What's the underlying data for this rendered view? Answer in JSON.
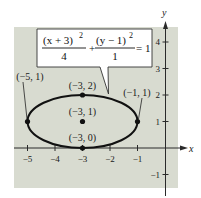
{
  "figure": {
    "background_color": "#d8dbd0",
    "axes": {
      "x_label": "x",
      "y_label": "y",
      "x_ticks": [
        {
          "value": -5,
          "label": "−5"
        },
        {
          "value": -4,
          "label": "−4"
        },
        {
          "value": -3,
          "label": "−3"
        },
        {
          "value": -2,
          "label": "−2"
        },
        {
          "value": -1,
          "label": "−1"
        }
      ],
      "y_ticks": [
        {
          "value": 4,
          "label": "4"
        },
        {
          "value": 3,
          "label": "3"
        },
        {
          "value": 2,
          "label": "2"
        },
        {
          "value": 1,
          "label": "1"
        },
        {
          "value": -1,
          "label": "−1"
        }
      ]
    },
    "equation": {
      "num1": "(x + 3)",
      "num1_exp": "2",
      "den1": "4",
      "plus": "+",
      "num2": "(y − 1)",
      "num2_exp": "2",
      "den2": "1",
      "equals": "= 1"
    },
    "ellipse": {
      "center": [
        -3,
        1
      ],
      "a": 2,
      "b": 1
    },
    "points": [
      {
        "name": "left-vertex",
        "coords": [
          -5,
          1
        ],
        "label": "(−5, 1)"
      },
      {
        "name": "right-vertex",
        "coords": [
          -1,
          1
        ],
        "label": "(−1, 1)"
      },
      {
        "name": "top-co-vertex",
        "coords": [
          -3,
          2
        ],
        "label": "(−3, 2)"
      },
      {
        "name": "bottom-co-vertex",
        "coords": [
          -3,
          0
        ],
        "label": "(−3, 0)"
      },
      {
        "name": "center",
        "coords": [
          -3,
          1
        ],
        "label": "(−3, 1)"
      }
    ]
  }
}
